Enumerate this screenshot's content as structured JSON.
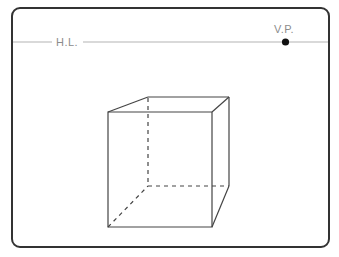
{
  "diagram": {
    "background_color": "#ffffff",
    "frame": {
      "name": "diagram-frame",
      "x": 11,
      "y": 7,
      "width": 319,
      "height": 241,
      "radius": 8,
      "stroke_color": "#333333",
      "stroke_width": 2
    },
    "horizon": {
      "label": "H.L.",
      "label_x": 67,
      "label_y": 46,
      "line_y": 42,
      "line_x1": 12,
      "line_x2": 329,
      "color": "#b3b3b3",
      "stroke_width": 1.2,
      "label_gap_x1": 52,
      "label_gap_x2": 83
    },
    "vanishing_point": {
      "label": "V.P.",
      "label_x": 284,
      "label_y": 33,
      "point_x": 285.5,
      "point_y": 42,
      "radius": 3.6,
      "color": "#111111",
      "label_color": "#8c8c8c"
    },
    "cube": {
      "name": "perspective-cube",
      "line_color": "#444444",
      "stroke_width": 1.2,
      "dash_pattern": "4,4",
      "front_face": {
        "top_left": [
          108,
          112
        ],
        "top_right": [
          212,
          112
        ],
        "bottom_right": [
          212,
          227
        ],
        "bottom_left": [
          108,
          227
        ]
      },
      "back_face": {
        "top_left": [
          148,
          97
        ],
        "top_right": [
          229,
          97
        ],
        "bottom_right": [
          229,
          186
        ],
        "bottom_left": [
          148,
          186
        ]
      },
      "visible_edges": [
        "front-top",
        "front-right",
        "front-bottom",
        "front-left",
        "top-left-receding",
        "top-right-receding",
        "back-top",
        "right-back-vertical",
        "bottom-right-receding"
      ],
      "hidden_edges": [
        "back-left-vertical",
        "back-bottom",
        "bottom-left-receding"
      ]
    }
  }
}
